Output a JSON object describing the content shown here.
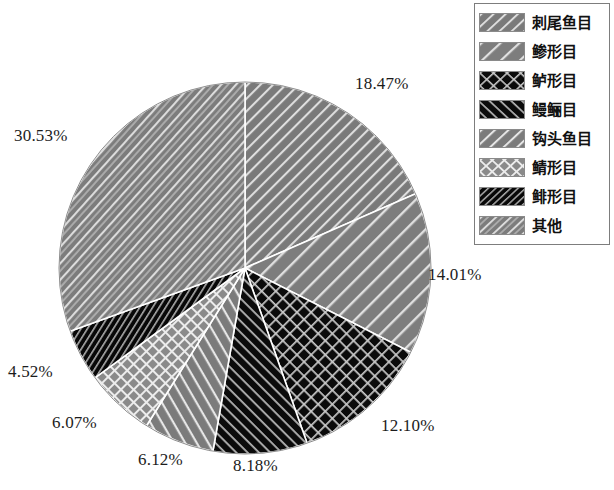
{
  "chart_data": {
    "type": "pie",
    "title": "",
    "categories": [
      "刺尾鱼目",
      "鲹形目",
      "鲈形目",
      "鳗鲡目",
      "钩头鱼目",
      "鲭形目",
      "鲱形目",
      "其他"
    ],
    "values": [
      18.47,
      14.01,
      12.1,
      8.18,
      6.12,
      6.07,
      4.52,
      30.53
    ],
    "value_labels": [
      "18.47%",
      "14.01%",
      "12.10%",
      "8.18%",
      "6.12%",
      "6.07%",
      "4.52%",
      "30.53%"
    ],
    "unit": "%",
    "start_angle_deg": 0,
    "direction": "clockwise",
    "legend_position": "top-right",
    "grid": false,
    "slices": [
      {
        "label": "刺尾鱼目",
        "value": 18.47,
        "value_label": "18.47%",
        "fill": "#7a7a7a",
        "pattern": "diagonal-stripes-up",
        "pattern_color": "#d8d8d8"
      },
      {
        "label": "鲹形目",
        "value": 14.01,
        "value_label": "14.01%",
        "fill": "#7d7d7d",
        "pattern": "diagonal-stripes-up-wide",
        "pattern_color": "#dcdcdc"
      },
      {
        "label": "鲈形目",
        "value": 12.1,
        "value_label": "12.10%",
        "fill": "#0b0b0b",
        "pattern": "crosshatch-diamond",
        "pattern_color": "#c6c6c6"
      },
      {
        "label": "鳗鲡目",
        "value": 8.18,
        "value_label": "8.18%",
        "fill": "#0b0b0b",
        "pattern": "diagonal-stripes-down",
        "pattern_color": "#b9b9b9"
      },
      {
        "label": "钩头鱼目",
        "value": 6.12,
        "value_label": "6.12%",
        "fill": "#7b7b7b",
        "pattern": "diagonal-stripes-down-wide",
        "pattern_color": "#e2e2e2"
      },
      {
        "label": "鲭形目",
        "value": 6.07,
        "value_label": "6.07%",
        "fill": "#8a8a8a",
        "pattern": "crosshatch-grid",
        "pattern_color": "#e8e8e8"
      },
      {
        "label": "鲱形目",
        "value": 4.52,
        "value_label": "4.52%",
        "fill": "#080808",
        "pattern": "diagonal-stripes-dense",
        "pattern_color": "#a8a8a8"
      },
      {
        "label": "其他",
        "value": 30.53,
        "value_label": "30.53%",
        "fill": "#7c7c7c",
        "pattern": "diagonal-stripes-up-mixed",
        "pattern_color": "#dadada"
      }
    ]
  },
  "pie": {
    "center_x": 245,
    "center_y": 268,
    "radius": 186,
    "edge_color": "#ffffff",
    "labels": [
      {
        "text": "18.47%",
        "left": 355,
        "top": 74
      },
      {
        "text": "14.01%",
        "left": 428,
        "top": 265
      },
      {
        "text": "12.10%",
        "left": 381,
        "top": 416
      },
      {
        "text": "8.18%",
        "left": 233,
        "top": 456
      },
      {
        "text": "6.12%",
        "left": 138,
        "top": 450
      },
      {
        "text": "6.07%",
        "left": 52,
        "top": 413
      },
      {
        "text": "4.52%",
        "left": 8,
        "top": 362
      },
      {
        "text": "30.53%",
        "left": 14,
        "top": 126
      }
    ]
  },
  "legend": {
    "items": [
      {
        "label": "刺尾鱼目",
        "swatch": "swatch-ciweiyumu"
      },
      {
        "label": "鲹形目",
        "swatch": "swatch-shenxingmu"
      },
      {
        "label": "鲈形目",
        "swatch": "swatch-luxingmu"
      },
      {
        "label": "鳗鲡目",
        "swatch": "swatch-manlimu"
      },
      {
        "label": "钩头鱼目",
        "swatch": "swatch-goutouyumu"
      },
      {
        "label": "鲭形目",
        "swatch": "swatch-qingxingmu"
      },
      {
        "label": "鲱形目",
        "swatch": "swatch-feixingmu"
      },
      {
        "label": "其他",
        "swatch": "swatch-qita"
      }
    ]
  }
}
